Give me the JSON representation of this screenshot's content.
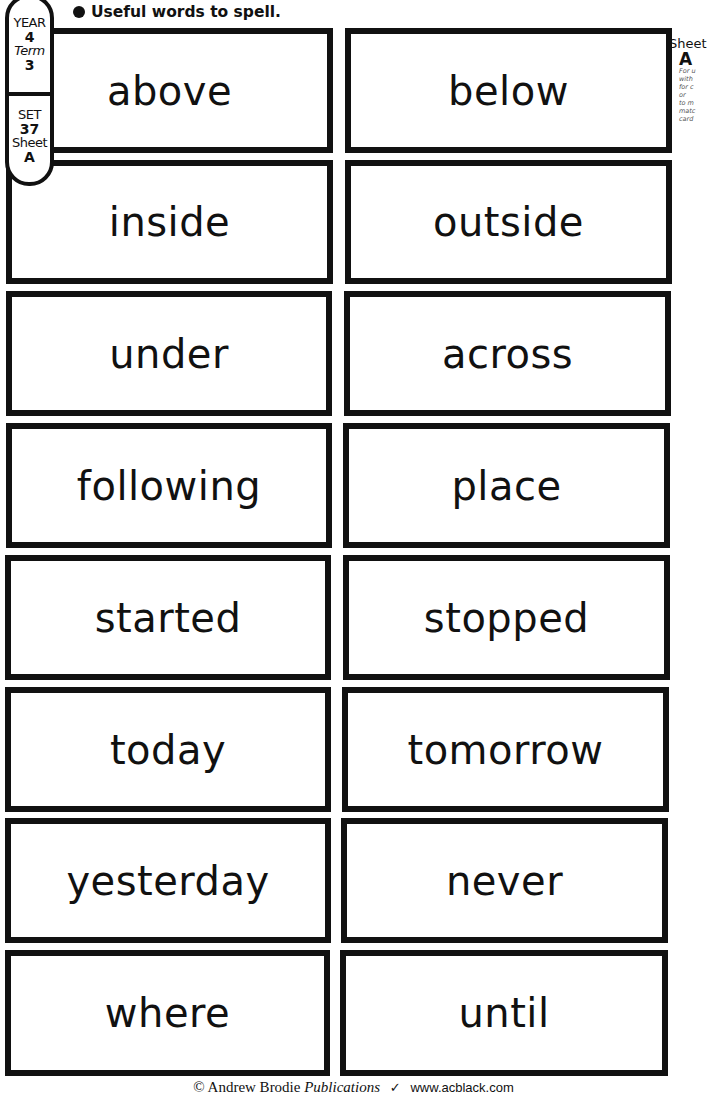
{
  "heading": {
    "bullet": "●",
    "text": "Useful words to spell."
  },
  "badge": {
    "year_label": "YEAR",
    "year_value": "4",
    "term_label": "Term",
    "term_value": "3",
    "set_label": "SET",
    "set_value": "37",
    "sheet_label": "Sheet",
    "sheet_value": "A"
  },
  "side_note": {
    "sheet_label": "Sheet",
    "sheet_value": "A",
    "lines": [
      "For u",
      "with",
      "for c",
      "or",
      "to m",
      "matc",
      "card"
    ]
  },
  "cards": [
    {
      "left": "above",
      "right": "below"
    },
    {
      "left": "inside",
      "right": "outside"
    },
    {
      "left": "under",
      "right": "across"
    },
    {
      "left": "following",
      "right": "place"
    },
    {
      "left": "started",
      "right": "stopped"
    },
    {
      "left": "today",
      "right": "tomorrow"
    },
    {
      "left": "yesterday",
      "right": "never"
    },
    {
      "left": "where",
      "right": "until"
    }
  ],
  "footer": {
    "copyright": "© Andrew Brodie",
    "publications": "Publications",
    "tick": "✓",
    "url": "www.acblack.com"
  }
}
